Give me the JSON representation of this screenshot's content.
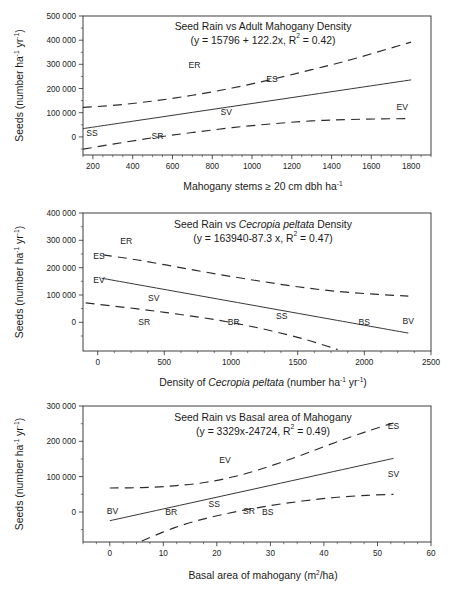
{
  "figure": {
    "background": "#ffffff",
    "ink": "#2b2b2b",
    "panel_count": 3
  },
  "chart_data": [
    {
      "id": "panel-1",
      "type": "line",
      "title": "Seed Rain vs Adult Mahogany Density",
      "equation": "(y = 15796 + 122.2x, R² = 0.42)",
      "equation_parts": {
        "prefix": "(y = 15796 + 122.2x, R",
        "superscript": "2",
        "suffix": " = 0.42)"
      },
      "regression": {
        "intercept": 15796,
        "slope": 122.2,
        "r_squared": 0.42
      },
      "xlabel_parts": {
        "text": "Mahogany stems ≥ 20 cm dbh ha",
        "superscript": "-1"
      },
      "xlabel": "Mahogany stems ≥ 20 cm dbh ha-1",
      "ylabel_parts": {
        "pre": "Seeds (number ha",
        "sup1": "-1",
        "mid": " yr",
        "sup2": "-1",
        "post": ")"
      },
      "ylabel": "Seeds (number ha-1 yr-1)",
      "xlim": [
        150,
        1900
      ],
      "ylim": [
        -75000,
        500000
      ],
      "xticks": [
        200,
        400,
        600,
        800,
        1000,
        1200,
        1400,
        1600,
        1800
      ],
      "xticklabels": [
        "200",
        "400",
        "600",
        "800",
        "1000",
        "1200",
        "1400",
        "1600",
        "1800"
      ],
      "yticks": [
        0,
        100000,
        200000,
        300000,
        400000,
        500000
      ],
      "yticklabels": [
        "0",
        "100 000",
        "200 000",
        "300 000",
        "400 000",
        "500 000"
      ],
      "grid": false,
      "legend": "none",
      "series": [
        {
          "name": "fit",
          "style": "solid",
          "x": [
            150,
            400,
            700,
            1000,
            1300,
            1600,
            1800
          ],
          "y": [
            34126,
            64676,
            101336,
            137996,
            174656,
            211316,
            235756
          ]
        },
        {
          "name": "upper-confidence-band",
          "style": "dashed",
          "x": [
            150,
            300,
            500,
            700,
            900,
            1100,
            1300,
            1500,
            1800
          ],
          "y": [
            122000,
            130000,
            148000,
            172000,
            202000,
            238000,
            278000,
            320000,
            392000
          ]
        },
        {
          "name": "lower-confidence-band",
          "style": "dashed",
          "x": [
            150,
            300,
            500,
            700,
            900,
            1100,
            1300,
            1500,
            1800
          ],
          "y": [
            -51000,
            -30000,
            -4000,
            18000,
            38000,
            54000,
            66000,
            72000,
            76000
          ]
        }
      ],
      "annotations": [
        {
          "label": "ER",
          "x": 710,
          "y": 298000
        },
        {
          "label": "ES",
          "x": 1100,
          "y": 238000
        },
        {
          "label": "SV",
          "x": 870,
          "y": 103000
        },
        {
          "label": "EV",
          "x": 1755,
          "y": 124000
        },
        {
          "label": "SS",
          "x": 195,
          "y": 18000
        },
        {
          "label": "SR",
          "x": 525,
          "y": 5000
        }
      ]
    },
    {
      "id": "panel-2",
      "type": "line",
      "title_parts": {
        "pre": "Seed Rain vs ",
        "italic": "Cecropia peltata",
        "post": " Density"
      },
      "title": "Seed Rain vs Cecropia peltata Density",
      "equation": "(y = 163940-87.3 x, R² = 0.47)",
      "equation_parts": {
        "prefix": "(y = 163940-87.3 x, R",
        "superscript": "2",
        "suffix": " = 0.47)"
      },
      "regression": {
        "intercept": 163940,
        "slope": -87.3,
        "r_squared": 0.47
      },
      "xlabel_parts": {
        "pre": "Density of ",
        "italic": "Cecropia peltata",
        "mid": "  (number ha",
        "sup1": "-1",
        "mid2": " yr",
        "sup2": "-1",
        "post": ")"
      },
      "xlabel": "Density of Cecropia peltata (number ha-1 yr-1)",
      "ylabel_parts": {
        "pre": "Seeds (number ha",
        "sup1": "-1",
        "mid": " yr",
        "sup2": "-1",
        "post": ")"
      },
      "ylabel": "Seeds (number ha-1 yr-1)",
      "xlim": [
        -110,
        2500
      ],
      "ylim": [
        -105000,
        400000
      ],
      "xticks": [
        0,
        500,
        1000,
        1500,
        2000,
        2500
      ],
      "xticklabels": [
        "0",
        "500",
        "1000",
        "1500",
        "2000",
        "2500"
      ],
      "yticks": [
        0,
        100000,
        200000,
        300000,
        400000
      ],
      "yticklabels": [
        "0",
        "100 000",
        "200 000",
        "300 000",
        "400 000"
      ],
      "grid": false,
      "legend": "none",
      "series": [
        {
          "name": "fit",
          "style": "solid",
          "x": [
            30,
            600,
            1200,
            1800,
            2330
          ],
          "y": [
            161321,
            111560,
            59180,
            6800,
            -39469
          ]
        },
        {
          "name": "upper-confidence-band",
          "style": "dashed",
          "x": [
            40,
            300,
            600,
            900,
            1200,
            1500,
            1800,
            2100,
            2330
          ],
          "y": [
            247000,
            228000,
            202000,
            176000,
            152000,
            130000,
            113000,
            102000,
            96000
          ]
        },
        {
          "name": "lower-confidence-band",
          "style": "dashed",
          "x": [
            -90,
            300,
            600,
            900,
            1200,
            1500,
            1700,
            1800
          ],
          "y": [
            71000,
            49000,
            30000,
            8000,
            -20000,
            -55000,
            -84000,
            -100000
          ]
        }
      ],
      "annotations": [
        {
          "label": "ER",
          "x": 215,
          "y": 297000
        },
        {
          "label": "ES",
          "x": 10,
          "y": 243000
        },
        {
          "label": "EV",
          "x": 10,
          "y": 155000
        },
        {
          "label": "SV",
          "x": 420,
          "y": 90000
        },
        {
          "label": "SR",
          "x": 350,
          "y": 3000
        },
        {
          "label": "BR",
          "x": 1020,
          "y": 2000
        },
        {
          "label": "SS",
          "x": 1380,
          "y": 24000
        },
        {
          "label": "BS",
          "x": 2000,
          "y": 3000
        },
        {
          "label": "BV",
          "x": 2330,
          "y": 5000
        }
      ]
    },
    {
      "id": "panel-3",
      "type": "line",
      "title": "Seed Rain vs Basal area of Mahogany",
      "equation": "(y = 3329x-24724, R² = 0.49)",
      "equation_parts": {
        "prefix": "(y = 3329x-24724, R",
        "superscript": "2",
        "suffix": " = 0.49)"
      },
      "regression": {
        "intercept": -24724,
        "slope": 3329,
        "r_squared": 0.49
      },
      "xlabel_parts": {
        "pre": "Basal area of mahogany (m",
        "sup": "2",
        "post": "/ha)"
      },
      "xlabel": "Basal area of mahogany (m2/ha)",
      "ylabel_parts": {
        "pre": "Seeds (number ha",
        "sup1": "-1",
        "mid": " yr",
        "sup2": "-1",
        "post": ")"
      },
      "ylabel": "Seeds (number ha-1 yr-1)",
      "xlim": [
        -5,
        60
      ],
      "ylim": [
        -85000,
        300000
      ],
      "xticks": [
        0,
        10,
        20,
        30,
        40,
        50,
        60
      ],
      "xticklabels": [
        "0",
        "10",
        "20",
        "30",
        "40",
        "50",
        "60"
      ],
      "yticks": [
        0,
        100000,
        200000,
        300000
      ],
      "yticklabels": [
        "0",
        "100 000",
        "200 000",
        "300 000"
      ],
      "grid": false,
      "legend": "none",
      "series": [
        {
          "name": "fit",
          "style": "solid",
          "x": [
            0,
            15,
            30,
            45,
            53
          ],
          "y": [
            -24724,
            25211,
            75146,
            125081,
            151713
          ]
        },
        {
          "name": "upper-confidence-band",
          "style": "dashed",
          "x": [
            0,
            6,
            12,
            18,
            24,
            30,
            36,
            42,
            48,
            53
          ],
          "y": [
            68000,
            69000,
            74000,
            84000,
            103000,
            130000,
            162000,
            196000,
            228000,
            252000
          ]
        },
        {
          "name": "lower-confidence-band",
          "style": "dashed",
          "x": [
            6,
            12,
            18,
            24,
            30,
            36,
            42,
            48,
            53
          ],
          "y": [
            -82000,
            -45000,
            -18000,
            2000,
            18000,
            31000,
            41000,
            47000,
            50000
          ]
        }
      ],
      "annotations": [
        {
          "label": "ES",
          "x": 53,
          "y": 243000
        },
        {
          "label": "EV",
          "x": 21.5,
          "y": 148000
        },
        {
          "label": "SV",
          "x": 53,
          "y": 108000
        },
        {
          "label": "BV",
          "x": 0.5,
          "y": 2000
        },
        {
          "label": "BR",
          "x": 11.5,
          "y": 1000
        },
        {
          "label": "SS",
          "x": 19.5,
          "y": 22000
        },
        {
          "label": "SR",
          "x": 26,
          "y": 4000
        },
        {
          "label": "BS",
          "x": 29.5,
          "y": 1000
        }
      ]
    }
  ]
}
